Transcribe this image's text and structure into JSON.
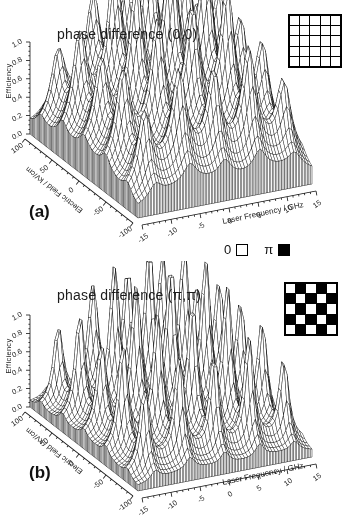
{
  "figure": {
    "panel_letters": [
      "(a)",
      "(b)"
    ],
    "background": "#ffffff",
    "line_color": "#1c1c1c"
  },
  "legend": {
    "zero_label": "0",
    "pi_label": "π",
    "zero_color": "#ffffff",
    "pi_color": "#000000"
  },
  "chart_data": [
    {
      "type": "surface",
      "render": "3d-wireframe-mesh",
      "panel": "a",
      "title": "phase difference (0,0)",
      "phase_difference": "(0,0)",
      "xlabel": "Laser Frequency / GHz",
      "ylabel": "Electric Field / kV/cm",
      "zlabel": "Efficiency",
      "xlim": [
        -15,
        15
      ],
      "ylim": [
        -100,
        100
      ],
      "zlim": [
        0,
        1
      ],
      "xticks": [
        -15,
        -10,
        -5,
        0,
        5,
        10,
        15
      ],
      "yticks": [
        -100,
        -50,
        0,
        50,
        100
      ],
      "zticks": [
        "0.0",
        "0.2",
        "0.4",
        "0.6",
        "0.8",
        "1.0"
      ],
      "peaks": {
        "x_centers_ghz": [
          -12,
          -6,
          0,
          6,
          12
        ],
        "y_centers_kvcm": [
          -80,
          -40,
          0,
          40,
          80
        ],
        "x_width_ghz": 1.25,
        "y_width_kvcm": 9,
        "baseline": 0.06,
        "heights": [
          [
            0.5,
            0.62,
            0.55,
            0.68,
            0.45
          ],
          [
            0.55,
            0.8,
            0.72,
            0.85,
            0.55
          ],
          [
            0.52,
            0.85,
            1.0,
            0.92,
            0.6
          ],
          [
            0.6,
            0.88,
            0.98,
            1.0,
            0.68
          ],
          [
            0.45,
            0.65,
            0.78,
            0.8,
            0.52
          ]
        ]
      },
      "phase_mask": [
        [
          0,
          0,
          0,
          0,
          0
        ],
        [
          0,
          0,
          0,
          0,
          0
        ],
        [
          0,
          0,
          0,
          0,
          0
        ],
        [
          0,
          0,
          0,
          0,
          0
        ],
        [
          0,
          0,
          0,
          0,
          0
        ]
      ]
    },
    {
      "type": "surface",
      "render": "3d-wireframe-mesh",
      "panel": "b",
      "title": "phase difference (π,π)",
      "phase_difference": "(π,π)",
      "xlabel": "Laser Frequency / GHz",
      "ylabel": "Electric Field / kV/cm",
      "zlabel": "Efficiency",
      "xlim": [
        -15,
        15
      ],
      "ylim": [
        -100,
        100
      ],
      "zlim": [
        0,
        1
      ],
      "xticks": [
        -15,
        -10,
        -5,
        0,
        5,
        10,
        15
      ],
      "yticks": [
        -100,
        -50,
        0,
        50,
        100
      ],
      "zticks": [
        "0.0",
        "0.2",
        "0.4",
        "0.6",
        "0.8",
        "1.0"
      ],
      "peaks": {
        "x_centers_ghz": [
          -12,
          -6,
          0,
          6,
          12
        ],
        "y_centers_kvcm": [
          -80,
          -40,
          0,
          40,
          80
        ],
        "x_width_ghz": 0.85,
        "y_width_kvcm": 6.5,
        "baseline": 0.028,
        "heights": [
          [
            0.6,
            0.72,
            0.65,
            0.75,
            0.55
          ],
          [
            0.72,
            0.9,
            0.85,
            0.95,
            0.68
          ],
          [
            0.62,
            0.95,
            1.0,
            0.98,
            0.72
          ],
          [
            0.7,
            0.98,
            1.0,
            1.0,
            0.78
          ],
          [
            0.55,
            0.75,
            0.85,
            0.88,
            0.62
          ]
        ]
      },
      "phase_mask": [
        [
          0,
          1,
          0,
          1,
          0
        ],
        [
          1,
          0,
          1,
          0,
          1
        ],
        [
          0,
          1,
          0,
          1,
          0
        ],
        [
          1,
          0,
          1,
          0,
          1
        ],
        [
          0,
          1,
          0,
          1,
          0
        ]
      ]
    }
  ]
}
